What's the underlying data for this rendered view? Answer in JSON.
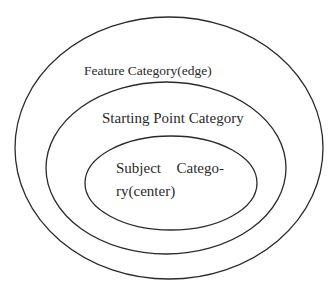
{
  "diagram": {
    "type": "nested-ellipses",
    "stroke_color": "#2a2a2a",
    "background": "#ffffff",
    "ellipses": [
      {
        "id": "outer",
        "label": "Feature Category(edge)",
        "cx": 169,
        "cy": 148,
        "rx": 154,
        "ry": 131
      },
      {
        "id": "middle",
        "label": "Starting Point Category",
        "cx": 166,
        "cy": 168,
        "rx": 120,
        "ry": 86
      },
      {
        "id": "inner",
        "label_line1_word1": "Subject",
        "label_line1_word2": "Catego-",
        "label_line2": "ry(center)",
        "cx": 171,
        "cy": 183,
        "rx": 86,
        "ry": 47
      }
    ]
  }
}
